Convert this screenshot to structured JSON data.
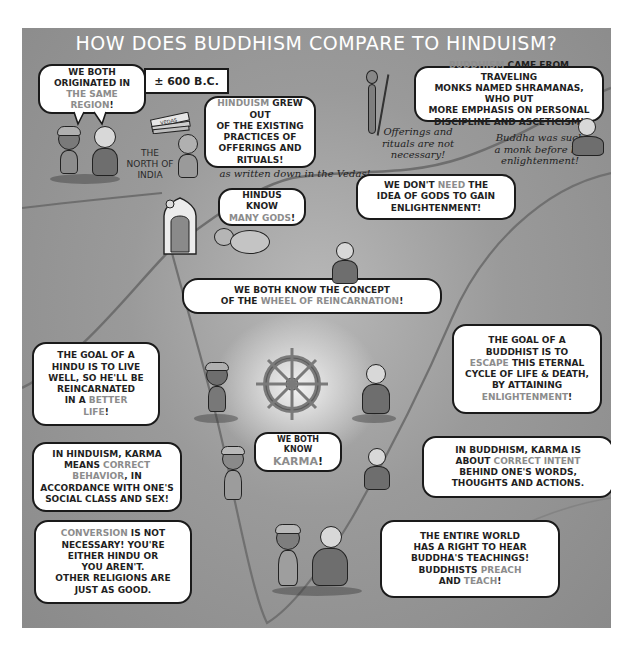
{
  "title": "HOW DOES BUDDHISM COMPARE TO HINDUISM?",
  "colors": {
    "panel_background": "#9a9a9a",
    "title_text": "#ffffff",
    "bubble_fill": "#ffffff",
    "bubble_outline": "#1a1a1a",
    "highlight_text": "#8c8c8c",
    "body_text": "#1f1f1f"
  },
  "date_label": "± 600 B.C.",
  "vedas_label": "VEDAS",
  "region_label": "THE NORTH OF INDIA",
  "notes": {
    "vedas_note": "as written down in the Vedas!",
    "offerings_note": "Offerings and rituals are not necessary!",
    "buddha_note": "Buddha was such a monk before his enlightenment!"
  },
  "bubbles": {
    "same_region": {
      "line1": "WE BOTH",
      "line2": "ORIGINATED IN",
      "highlight": "THE SAME REGION",
      "end": "!"
    },
    "hinduism_origin": {
      "highlight": "HINDUISM",
      "line1_rest": " GREW OUT",
      "line2": "OF THE EXISTING",
      "line3": "PRACTICES OF",
      "line4": "OFFERINGS AND",
      "line5": "RITUALS!"
    },
    "buddhism_origin": {
      "highlight": "BUDDHISM",
      "line1_rest": " CAME FROM TRAVELING",
      "line2": "MONKS NAMED SHRAMANAS, WHO PUT",
      "line3": "MORE EMPHASIS ON PERSONAL",
      "line4": "DISCIPLINE AND ASCETICISM!"
    },
    "many_gods": {
      "line1": "HINDUS KNOW",
      "highlight": "MANY GODS",
      "end": "!"
    },
    "no_gods": {
      "line1_start": "WE DON'T ",
      "highlight": "NEED",
      "line1_end": " THE",
      "line2": "IDEA OF GODS TO GAIN",
      "line3": "ENLIGHTENMENT!"
    },
    "reincarnation": {
      "line1": "WE BOTH KNOW THE CONCEPT",
      "line2_start": "OF THE ",
      "highlight": "WHEEL OF REINCARNATION",
      "end": "!"
    },
    "hindu_goal": {
      "line1": "THE GOAL OF A",
      "line2": "HINDU IS TO LIVE",
      "line3": "WELL, SO HE'LL BE",
      "line4": "REINCARNATED",
      "line5_start": "IN A ",
      "highlight1": "BETTER",
      "highlight2": "LIFE",
      "end": "!"
    },
    "buddhist_goal": {
      "line1": "THE GOAL OF A",
      "line2": "BUDDHIST IS TO",
      "highlight1": "ESCAPE",
      "line3_rest": " THIS ETERNAL",
      "line4": "CYCLE OF LIFE & DEATH,",
      "line5": "BY ATTAINING",
      "highlight2": "ENLIGHTENMENT",
      "end": "!"
    },
    "hindu_karma": {
      "line1": "IN HINDUISM, KARMA",
      "line2_start": "MEANS ",
      "highlight1": "CORRECT",
      "highlight2": "BEHAVIOR",
      "line3_rest": ", IN",
      "line4": "ACCORDANCE WITH ONE'S",
      "line5": "SOCIAL CLASS AND SEX!"
    },
    "both_karma": {
      "line1": "WE BOTH KNOW",
      "highlight": "KARMA",
      "end": "!"
    },
    "buddhist_karma": {
      "line1": "IN BUDDHISM, KARMA IS",
      "line2_start": "ABOUT ",
      "highlight": "CORRECT INTENT",
      "line3": "BEHIND ONE'S WORDS,",
      "line4": "THOUGHTS AND ACTIONS."
    },
    "hindu_conversion": {
      "highlight": "CONVERSION",
      "line1_rest": " IS NOT",
      "line2": "NECESSARY! YOU'RE",
      "line3": "EITHER HINDU OR",
      "line4": "YOU AREN'T.",
      "line5": "OTHER RELIGIONS ARE",
      "line6": "JUST AS GOOD."
    },
    "buddhist_preach": {
      "line1": "THE ENTIRE WORLD",
      "line2": "HAS A RIGHT TO HEAR",
      "line3": "BUDDHA'S TEACHINGS!",
      "line4_start": "BUDDHISTS ",
      "highlight1": "PREACH",
      "line5_start": "AND ",
      "highlight2": "TEACH",
      "end": "!"
    }
  },
  "icons": {
    "wheel": "dharma-wheel-icon",
    "shrine": "shrine-icon",
    "scroll": "vedas-scrolls-icon"
  }
}
